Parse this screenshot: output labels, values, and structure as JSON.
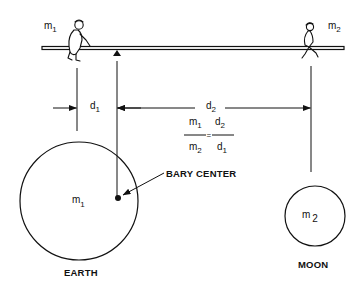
{
  "diagram": {
    "seesaw": {
      "left_person_label": {
        "base": "m",
        "sub": "1"
      },
      "right_person_label": {
        "base": "m",
        "sub": "2"
      }
    },
    "distances": {
      "d1": {
        "base": "d",
        "sub": "1"
      },
      "d2": {
        "base": "d",
        "sub": "2"
      }
    },
    "formula": {
      "lhs_num": {
        "base": "m",
        "sub": "1"
      },
      "lhs_den": {
        "base": "m",
        "sub": "2"
      },
      "equals": "=",
      "rhs_num": {
        "base": "d",
        "sub": "2"
      },
      "rhs_den": {
        "base": "d",
        "sub": "1"
      }
    },
    "earth": {
      "mass_label": {
        "base": "m",
        "sub": "1"
      },
      "caption": "EARTH"
    },
    "moon": {
      "mass_label": {
        "base": "m",
        "sub": "2"
      },
      "caption": "MOON"
    },
    "barycenter_label": "BARY CENTER",
    "colors": {
      "ink": "#111111",
      "background": "#ffffff"
    }
  }
}
